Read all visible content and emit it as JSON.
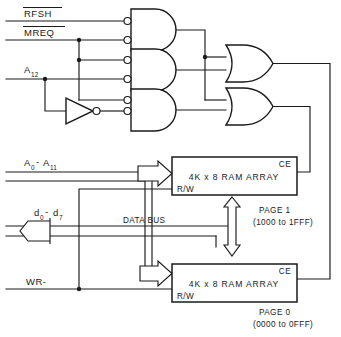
{
  "diagram": {
    "type": "logic-schematic",
    "colors": {
      "line": "#1a1a1a",
      "background": "#ffffff",
      "fill": "#ffffff"
    }
  },
  "inputs": {
    "rfsh": {
      "label": "RFSH",
      "overline": true
    },
    "mreq": {
      "label": "MREQ",
      "overline": true
    },
    "a12": {
      "label": "A",
      "subscript": "12"
    },
    "addr_bus": {
      "label_a": "A",
      "sub_a": "0",
      "dash": "-",
      "label_b": "A",
      "sub_b": "11"
    },
    "data_bus": {
      "label_a": "d",
      "sub_a": "0",
      "dash": "-",
      "label_b": "d",
      "sub_b": "7"
    },
    "wr": {
      "label": "WR-"
    }
  },
  "buses": {
    "data_bus_label": "DATA BUS"
  },
  "gates": [
    {
      "id": "nand1",
      "type": "and-with-inverted-inputs",
      "inputs": [
        "RFSH",
        "MREQ"
      ]
    },
    {
      "id": "nand2",
      "type": "and-with-inverted-inputs",
      "inputs": [
        "MREQ",
        "A12"
      ]
    },
    {
      "id": "nand3",
      "type": "and-with-inverted-inputs",
      "inputs": [
        "MREQ",
        "A12-inverted"
      ]
    },
    {
      "id": "inv1",
      "type": "inverter",
      "inputs": [
        "A12"
      ]
    },
    {
      "id": "or1",
      "type": "or",
      "inputs": [
        "nand1",
        "nand2"
      ]
    },
    {
      "id": "or2",
      "type": "or",
      "inputs": [
        "nand1",
        "nand3"
      ]
    }
  ],
  "blocks": {
    "page1": {
      "title": "4K x 8 RAM ARRAY",
      "ce_pin": "CE",
      "rw_pin": "R/W",
      "page_label": "PAGE 1",
      "range_label": "(1000 to 1FFF)"
    },
    "page0": {
      "title": "4K x 8 RAM ARRAY",
      "ce_pin": "CE",
      "rw_pin": "R/W",
      "page_label": "PAGE 0",
      "range_label": "(0000 to 0FFF)"
    }
  }
}
